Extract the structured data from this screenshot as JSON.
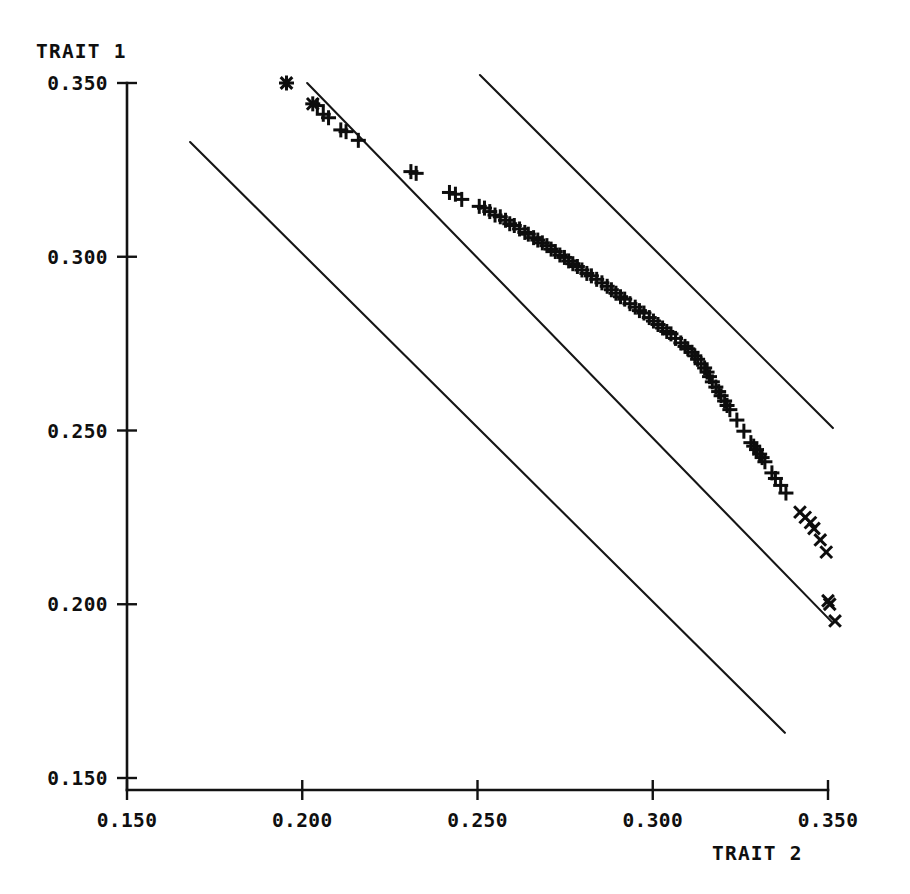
{
  "chart_data": {
    "type": "scatter",
    "title": "",
    "xlabel": "TRAIT 2",
    "ylabel": "TRAIT 1",
    "xlim": [
      0.15,
      0.35
    ],
    "ylim": [
      0.15,
      0.35
    ],
    "xticks": [
      0.15,
      0.2,
      0.25,
      0.3,
      0.35
    ],
    "yticks": [
      0.15,
      0.2,
      0.25,
      0.3,
      0.35
    ],
    "xticklabels": [
      "0.150",
      "0.200",
      "0.250",
      "0.300",
      "0.350"
    ],
    "yticklabels": [
      "0.150",
      "0.200",
      "0.250",
      "0.300",
      "0.350"
    ],
    "grid": false,
    "legend": null,
    "marker": "plus-and-cross",
    "series": [
      {
        "name": "observations",
        "marker": "+",
        "points": [
          [
            0.1955,
            0.35
          ],
          [
            0.203,
            0.344
          ],
          [
            0.2043,
            0.3435
          ],
          [
            0.206,
            0.341
          ],
          [
            0.2075,
            0.34
          ],
          [
            0.211,
            0.3365
          ],
          [
            0.2125,
            0.336
          ],
          [
            0.216,
            0.3335
          ],
          [
            0.231,
            0.3245
          ],
          [
            0.2325,
            0.324
          ],
          [
            0.242,
            0.3185
          ],
          [
            0.2437,
            0.318
          ],
          [
            0.2455,
            0.3165
          ],
          [
            0.2505,
            0.3145
          ],
          [
            0.252,
            0.314
          ],
          [
            0.2535,
            0.313
          ],
          [
            0.255,
            0.312
          ],
          [
            0.2565,
            0.3115
          ],
          [
            0.258,
            0.3105
          ],
          [
            0.2592,
            0.3095
          ],
          [
            0.2605,
            0.309
          ],
          [
            0.262,
            0.308
          ],
          [
            0.2635,
            0.307
          ],
          [
            0.2645,
            0.3065
          ],
          [
            0.266,
            0.3055
          ],
          [
            0.2672,
            0.3048
          ],
          [
            0.2685,
            0.304
          ],
          [
            0.2698,
            0.3032
          ],
          [
            0.271,
            0.3022
          ],
          [
            0.2722,
            0.3015
          ],
          [
            0.2735,
            0.3005
          ],
          [
            0.2748,
            0.2998
          ],
          [
            0.276,
            0.2988
          ],
          [
            0.2772,
            0.298
          ],
          [
            0.2785,
            0.2972
          ],
          [
            0.2798,
            0.2962
          ],
          [
            0.2812,
            0.2952
          ],
          [
            0.2825,
            0.2945
          ],
          [
            0.284,
            0.2935
          ],
          [
            0.2855,
            0.2925
          ],
          [
            0.287,
            0.2915
          ],
          [
            0.2882,
            0.2905
          ],
          [
            0.2895,
            0.2895
          ],
          [
            0.2908,
            0.2885
          ],
          [
            0.292,
            0.2878
          ],
          [
            0.2935,
            0.2865
          ],
          [
            0.295,
            0.2855
          ],
          [
            0.2962,
            0.2845
          ],
          [
            0.2975,
            0.2838
          ],
          [
            0.299,
            0.2825
          ],
          [
            0.3002,
            0.2815
          ],
          [
            0.3015,
            0.2805
          ],
          [
            0.3028,
            0.2795
          ],
          [
            0.304,
            0.2785
          ],
          [
            0.3052,
            0.2778
          ],
          [
            0.3065,
            0.2765
          ],
          [
            0.308,
            0.2752
          ],
          [
            0.3092,
            0.2742
          ],
          [
            0.31,
            0.2735
          ],
          [
            0.3112,
            0.2725
          ],
          [
            0.312,
            0.2715
          ],
          [
            0.3128,
            0.2705
          ],
          [
            0.3138,
            0.2692
          ],
          [
            0.3148,
            0.268
          ],
          [
            0.3155,
            0.2668
          ],
          [
            0.3162,
            0.2655
          ],
          [
            0.317,
            0.264
          ],
          [
            0.318,
            0.2625
          ],
          [
            0.3188,
            0.2612
          ],
          [
            0.3195,
            0.26
          ],
          [
            0.3205,
            0.2585
          ],
          [
            0.3212,
            0.2572
          ],
          [
            0.322,
            0.256
          ],
          [
            0.324,
            0.253
          ],
          [
            0.326,
            0.2498
          ],
          [
            0.328,
            0.2465
          ],
          [
            0.3288,
            0.2455
          ],
          [
            0.3296,
            0.2445
          ],
          [
            0.3305,
            0.2432
          ],
          [
            0.3312,
            0.2422
          ],
          [
            0.332,
            0.241
          ],
          [
            0.334,
            0.2378
          ],
          [
            0.335,
            0.2362
          ],
          [
            0.3365,
            0.2342
          ],
          [
            0.338,
            0.232
          ]
        ]
      },
      {
        "name": "extreme-observations",
        "marker": "x",
        "points": [
          [
            0.1955,
            0.35
          ],
          [
            0.203,
            0.344
          ],
          [
            0.342,
            0.2265
          ],
          [
            0.3435,
            0.225
          ],
          [
            0.345,
            0.2235
          ],
          [
            0.346,
            0.2218
          ],
          [
            0.3478,
            0.2185
          ],
          [
            0.3495,
            0.215
          ],
          [
            0.35,
            0.201
          ],
          [
            0.3505,
            0.2
          ],
          [
            0.352,
            0.1952
          ]
        ]
      }
    ],
    "reference_lines": [
      {
        "name": "upper-bound-line",
        "x": [
          0.2507,
          0.3514
        ],
        "y": [
          0.3523,
          0.2507
        ]
      },
      {
        "name": "central-regression-line",
        "x": [
          0.2014,
          0.351
        ],
        "y": [
          0.35,
          0.195
        ]
      },
      {
        "name": "lower-bound-line",
        "x": [
          0.168,
          0.3377
        ],
        "y": [
          0.333,
          0.163
        ]
      }
    ]
  },
  "axes": {
    "y_axis_title": "TRAIT 1",
    "x_axis_title": "TRAIT 2"
  },
  "colors": {
    "ink": "#111111",
    "background": "#ffffff"
  }
}
